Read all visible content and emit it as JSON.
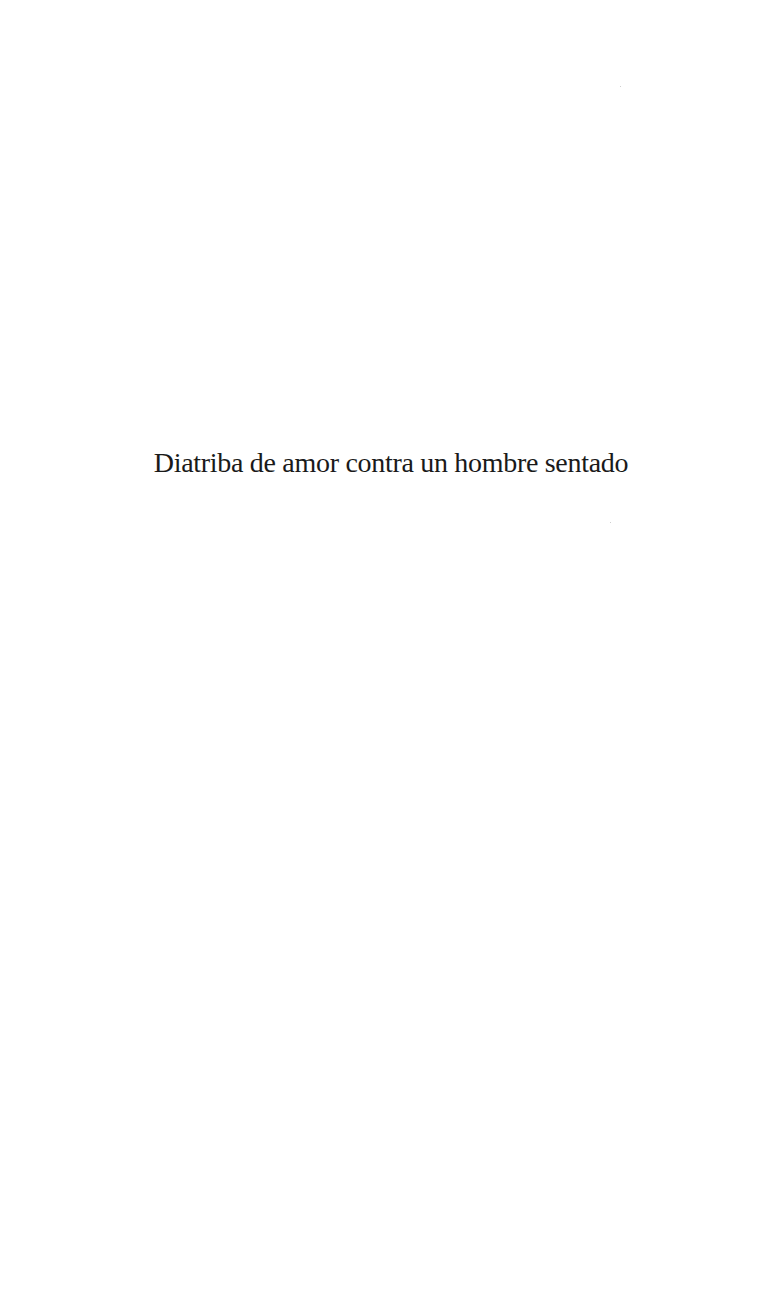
{
  "page": {
    "title": "Diatriba de amor contra un hombre sentado",
    "background_color": "#ffffff",
    "text_color": "#1a1a1a"
  }
}
